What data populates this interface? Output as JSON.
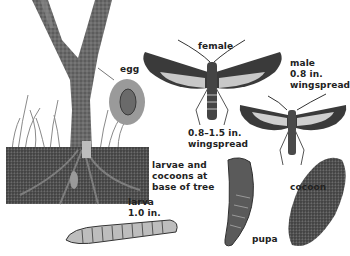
{
  "labels": {
    "egg": "egg",
    "female": "female",
    "female_size_1": "0.8–1.5 in.",
    "female_size_2": "wingspread",
    "male": "male",
    "male_size_1": "0.8 in.",
    "male_size_2": "wingspread",
    "larvae_1": "larvae and",
    "larvae_2": "cocoons at",
    "larvae_3": "base of tree",
    "larva": "larva",
    "larva_size": "1.0 in.",
    "pupa": "pupa",
    "cocoon": "cocoon"
  },
  "colors": {
    "trunk": "#6e6e6e",
    "soil": "#4a4a4a",
    "grass": "#8a8a8a",
    "wing_dark": "#3a3a3a",
    "wing_light": "#c8c8c8",
    "cocoon": "#6a6a6a"
  }
}
